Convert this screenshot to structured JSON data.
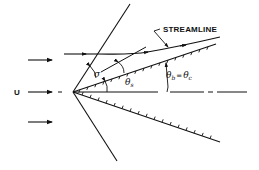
{
  "diagram": {
    "type": "supersonic flow over cone/wedge with attached oblique shock",
    "labels": {
      "streamline": "STREAMLINE",
      "freestream": "U",
      "shock_angle": "σ",
      "flow_angle": "θ",
      "flow_angle_sub": "s",
      "body_angle": "θ",
      "body_angle_sub": "b",
      "equals": "=",
      "cone_angle": "θ",
      "cone_angle_sub": "c"
    },
    "elements": [
      {
        "id": "shock-wave",
        "kind": "line",
        "description": "straight oblique shock through apex"
      },
      {
        "id": "upper-body-surface",
        "kind": "hatched-line",
        "description": "upper cone surface"
      },
      {
        "id": "lower-body-surface",
        "kind": "hatched-line",
        "description": "lower cone surface"
      },
      {
        "id": "centerline",
        "kind": "dash-dot-line",
        "description": "axis of symmetry"
      },
      {
        "id": "streamline",
        "kind": "arrowed-curve",
        "description": "streamline deflected at shock, curving toward surface"
      },
      {
        "id": "freestream-arrows",
        "kind": "arrows",
        "count": 3
      }
    ],
    "colors": {
      "ink": "#111111",
      "background": "#ffffff"
    }
  }
}
